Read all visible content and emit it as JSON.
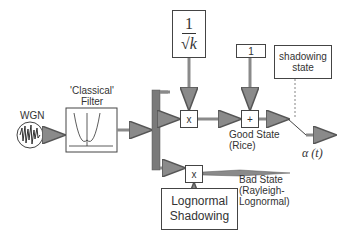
{
  "diagram": {
    "wgn_label": "WGN",
    "filter_label_line1": "'Classical'",
    "filter_label_line2": "Filter",
    "scale_factor": {
      "numerator": "1",
      "denominator": "√k"
    },
    "multiply_top": "x",
    "add_block": "+",
    "constant_one": "1",
    "shadowing_state_line1": "shadowing",
    "shadowing_state_line2": "state",
    "good_state_line1": "Good State",
    "good_state_line2": "(Rice)",
    "output_label": "α (t)",
    "multiply_bottom": "x",
    "lognormal_line1": "Lognormal",
    "lognormal_line2": "Shadowing",
    "bad_state_line1": "Bad State",
    "bad_state_line2": "(Rayleigh-",
    "bad_state_line3": "Lognormal)"
  },
  "colors": {
    "arrow_fill": "#8a8a8a",
    "bar_fill": "#7a7a7a",
    "stroke": "#444444"
  }
}
